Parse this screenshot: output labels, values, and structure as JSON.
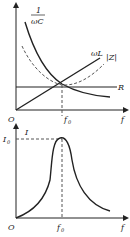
{
  "top_plot": {
    "origin_label": "O",
    "x_axis_label": "f",
    "resonance_label": "f",
    "resonance_sub": "0",
    "curves": [
      {
        "name": "capacitive-reactance",
        "label_num": "1",
        "label_den": "ωC",
        "style": "solid"
      },
      {
        "name": "inductive-reactance",
        "label": "ωL",
        "style": "solid"
      },
      {
        "name": "impedance-magnitude",
        "label": "|Z|",
        "style": "dashed"
      },
      {
        "name": "resistance",
        "label": "R",
        "style": "solid"
      }
    ]
  },
  "bottom_plot": {
    "origin_label": "O",
    "x_axis_label": "f",
    "y_axis_label": "I",
    "peak_label": "I",
    "peak_sub": "0",
    "resonance_label": "f",
    "resonance_sub": "0",
    "curves": [
      {
        "name": "current-resonance",
        "style": "solid"
      }
    ]
  }
}
